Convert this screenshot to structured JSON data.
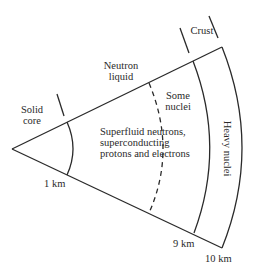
{
  "diagram": {
    "colors": {
      "line": "#2a2a2a",
      "text": "#2a2a2a",
      "background": "#ffffff"
    },
    "regions": {
      "solid_core": {
        "line1": "Solid",
        "line2": "core"
      },
      "neutron_liquid": {
        "line1": "Neutron",
        "line2": "liquid"
      },
      "some_nuclei": {
        "line1": "Some",
        "line2": "nuclei"
      },
      "superfluid": {
        "line1": "Superfluid neutrons,",
        "line2": "superconducting",
        "line3": "protons and electrons"
      },
      "crust": {
        "label": "Crust"
      },
      "heavy_nuclei": {
        "label": "Heavy nuclei"
      }
    },
    "radii": {
      "r1": "1 km",
      "r9": "9 km",
      "r10": "10 km"
    }
  }
}
